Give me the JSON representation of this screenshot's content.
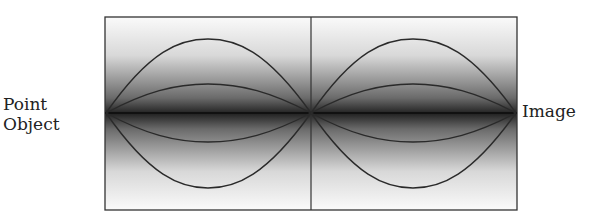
{
  "diagram": {
    "labels": {
      "left_line1": "Point",
      "left_line2": "Object",
      "right": "Image"
    },
    "colors": {
      "line": "#2a2a2a",
      "gradient_center": "#1a1a1a",
      "gradient_edge": "#ffffff"
    }
  }
}
